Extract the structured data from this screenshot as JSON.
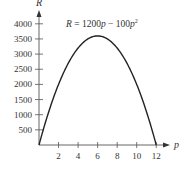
{
  "chart_data": {
    "type": "line",
    "title": "",
    "equation": "R = 1200p − 100p²",
    "equation_parts": {
      "lhs": "R",
      "eq": " = 1200",
      "p1": "p",
      "mid": " − 100",
      "p2": "p",
      "exp": "2"
    },
    "xlabel": "p",
    "ylabel": "R",
    "xlim": [
      0,
      12.8
    ],
    "ylim": [
      0,
      4200
    ],
    "x_ticks": [
      2,
      4,
      6,
      8,
      10,
      12
    ],
    "x_tick_labels": [
      "2",
      "4",
      "6",
      "8",
      "10",
      "12"
    ],
    "y_ticks": [
      500,
      1000,
      1500,
      2000,
      2500,
      3000,
      3500,
      4000
    ],
    "y_tick_labels": [
      "500",
      "1000",
      "1500",
      "2000",
      "2500",
      "3000",
      "3500",
      "4000"
    ],
    "grid": false,
    "series": [
      {
        "name": "R = 1200p − 100p²",
        "x": [
          0,
          1,
          2,
          3,
          4,
          5,
          6,
          7,
          8,
          9,
          10,
          11,
          12
        ],
        "y": [
          0,
          1100,
          2000,
          2700,
          3200,
          3500,
          3600,
          3500,
          3200,
          2700,
          2000,
          1100,
          0
        ]
      }
    ]
  }
}
